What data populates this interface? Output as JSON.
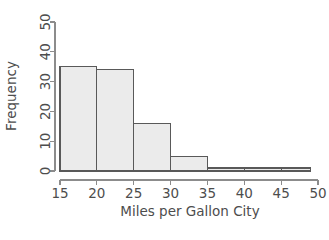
{
  "chart_data": {
    "type": "bar",
    "title": "",
    "subtitle": "",
    "xlabel": "Miles per Gallon City",
    "ylabel": "Frequency",
    "xlim": [
      15,
      50
    ],
    "ylim": [
      0,
      50
    ],
    "grid": false,
    "legend": "none",
    "bin_width": 5,
    "bin_edges": [
      15,
      20,
      25,
      30,
      35,
      40,
      45,
      49
    ],
    "categories": [
      "15-20",
      "20-25",
      "25-30",
      "30-35",
      "35-40",
      "40-45",
      "45-49"
    ],
    "values": [
      35,
      34,
      16,
      5,
      1,
      1,
      1
    ],
    "xticks": [
      15,
      20,
      25,
      30,
      35,
      40,
      45,
      50
    ],
    "xtick_labels": [
      "15",
      "20",
      "25",
      "30",
      "35",
      "40",
      "45",
      "50"
    ],
    "yticks": [
      0,
      10,
      20,
      30,
      40,
      50
    ],
    "ytick_labels": [
      "0",
      "10",
      "20",
      "30",
      "40",
      "50"
    ],
    "colors": {
      "bar_fill": "#ebebeb",
      "bar_stroke": "#595959",
      "axis": "#8c8c8c",
      "text": "#4d4d4d",
      "background": "#ffffff"
    }
  },
  "caption": {
    "cut_off_text": ""
  }
}
